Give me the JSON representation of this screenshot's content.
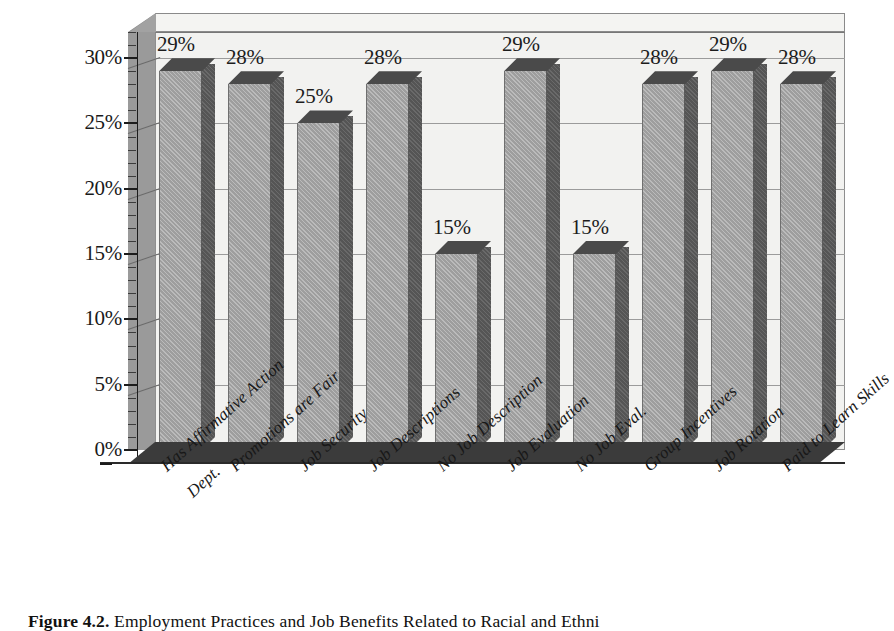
{
  "chart_data": {
    "type": "bar",
    "title": "",
    "subtitle": "",
    "xlabel": "",
    "ylabel": "",
    "ylim": [
      0,
      32
    ],
    "ytick_values": [
      0,
      5,
      10,
      15,
      20,
      25,
      30
    ],
    "ytick_labels": [
      "0%",
      "5%",
      "10%",
      "15%",
      "20%",
      "25%",
      "30%"
    ],
    "minor_tick_step": 1,
    "grid": true,
    "grid_axis": "y",
    "legend": null,
    "legend_position": "none",
    "style_3d": true,
    "categories": [
      "Has Affirmative Action Dept.",
      "Promotions are Fair",
      "Job Security",
      "Job Descriptions",
      "No Job Description",
      "Job Evaluation",
      "No Job Eval.",
      "Group Incentives",
      "Job Rotation",
      "Paid to Learn Skills"
    ],
    "category_label_lines": [
      [
        "Has Affirmative Action",
        "Dept."
      ],
      [
        "Promotions are Fair"
      ],
      [
        "Job Security"
      ],
      [
        "Job Descriptions"
      ],
      [
        "No Job Description"
      ],
      [
        "Job Evaluation"
      ],
      [
        "No Job Eval."
      ],
      [
        "Group Incentives"
      ],
      [
        "Job Rotation"
      ],
      [
        "Paid to Learn Skills"
      ]
    ],
    "values": [
      29,
      28,
      25,
      28,
      15,
      29,
      15,
      28,
      29,
      28
    ],
    "value_labels": [
      "29%",
      "28%",
      "25%",
      "28%",
      "15%",
      "29%",
      "15%",
      "28%",
      "29%",
      "28%"
    ],
    "colors": {
      "bar_front": "#9e9e9e",
      "bar_top": "#4a4a4a",
      "bar_side": "#555555",
      "plot_background": "#f2f2f0",
      "side_wall": "#9a9a9a",
      "floor": "#3b3b3b",
      "gridline": "#9b9b9b",
      "text": "#1a1a1a",
      "page_background": "#ffffff"
    }
  },
  "caption": {
    "label": "Figure 4.2.",
    "text": "Employment Practices and Job Benefits Related to Racial and Ethni"
  }
}
